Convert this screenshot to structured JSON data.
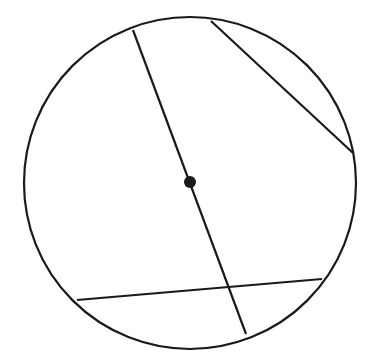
{
  "diagram": {
    "type": "circle-with-chords",
    "stroke_color": "#1a1a1a",
    "background": "#ffffff",
    "circle": {
      "cx": 190,
      "cy": 183,
      "r": 166
    },
    "center_point": {
      "cx": 190,
      "cy": 182,
      "r": 6
    },
    "segments": [
      {
        "name": "diameter",
        "x1": 133,
        "y1": 30,
        "x2": 246,
        "y2": 334
      },
      {
        "name": "upper-right-chord",
        "x1": 211,
        "y1": 21,
        "x2": 353,
        "y2": 153
      },
      {
        "name": "lower-chord",
        "x1": 77,
        "y1": 300,
        "x2": 322,
        "y2": 279
      }
    ]
  }
}
